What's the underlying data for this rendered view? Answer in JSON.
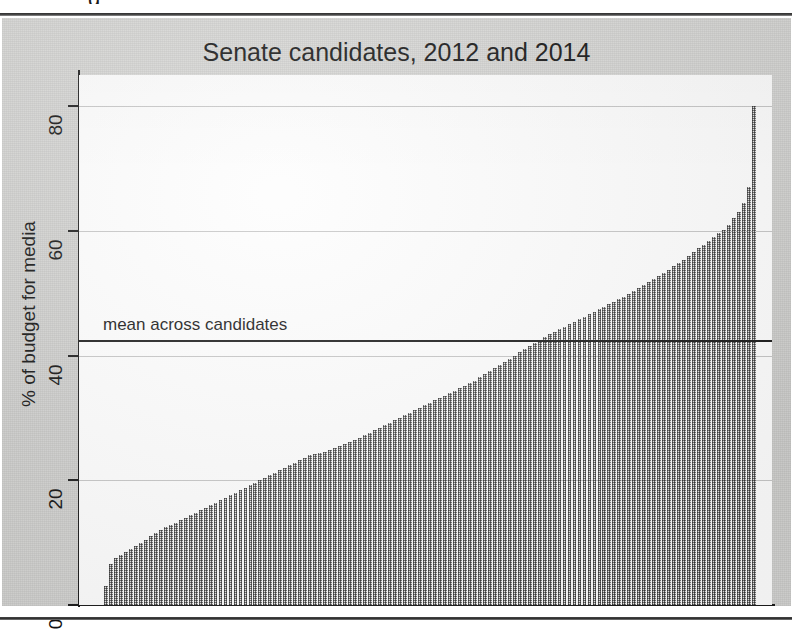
{
  "page": {
    "clipped_header_fragment": "g",
    "figure_background": "#d3d3d1",
    "rule_color": "#2e2e2e"
  },
  "chart_data": {
    "type": "bar",
    "title": "Senate candidates, 2012 and 2014",
    "xlabel": "",
    "ylabel": "% of budget for media",
    "ylim": [
      0,
      85
    ],
    "yticks": [
      0,
      20,
      40,
      60,
      80
    ],
    "ytick_labels": [
      "0",
      "20",
      "40",
      "60",
      "80"
    ],
    "grid": "horizontal",
    "legend": "none",
    "bar_color": "#6f6f6f",
    "annotations": [
      {
        "name": "mean-across-candidates",
        "label": "mean across candidates",
        "type": "hline",
        "value": 42.5,
        "color": "#1d1d1d"
      }
    ],
    "categories_note": "Senate candidates sorted ascending by share of budget spent on media; no x tick labels shown",
    "n_bars": 131,
    "values": [
      3.0,
      6.5,
      7.5,
      8.0,
      8.5,
      9.0,
      9.5,
      10.0,
      10.5,
      11.0,
      11.5,
      12.0,
      12.5,
      12.8,
      13.2,
      13.6,
      14.0,
      14.4,
      14.8,
      15.2,
      15.6,
      16.0,
      16.4,
      16.8,
      17.2,
      17.6,
      18.0,
      18.4,
      18.8,
      19.2,
      19.6,
      20.0,
      20.4,
      20.8,
      21.2,
      21.6,
      22.0,
      22.4,
      22.8,
      23.2,
      23.6,
      24.0,
      24.2,
      24.4,
      24.6,
      24.9,
      25.2,
      25.5,
      25.8,
      26.1,
      26.4,
      26.8,
      27.2,
      27.6,
      28.0,
      28.4,
      28.8,
      29.2,
      29.6,
      30.0,
      30.4,
      30.8,
      31.2,
      31.6,
      32.0,
      32.4,
      32.8,
      33.2,
      33.6,
      34.0,
      34.4,
      34.8,
      35.2,
      35.6,
      36.0,
      36.5,
      37.0,
      37.5,
      38.0,
      38.5,
      39.0,
      39.5,
      40.0,
      40.5,
      41.0,
      41.5,
      42.0,
      42.5,
      43.0,
      43.4,
      43.8,
      44.2,
      44.6,
      45.0,
      45.4,
      45.8,
      46.2,
      46.6,
      47.0,
      47.4,
      47.8,
      48.2,
      48.6,
      49.0,
      49.4,
      49.8,
      50.3,
      50.8,
      51.3,
      51.8,
      52.3,
      52.8,
      53.3,
      53.8,
      54.3,
      54.8,
      55.4,
      56.0,
      56.6,
      57.2,
      57.8,
      58.4,
      59.0,
      59.6,
      60.2,
      61.0,
      62.0,
      63.0,
      64.5,
      67.0,
      80.0
    ]
  }
}
